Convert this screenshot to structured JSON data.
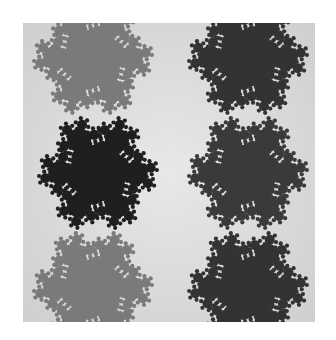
{
  "image": {
    "description": "Grayscale fractal tiling of snowflake-like dendritic clusters",
    "frame": {
      "x": 23,
      "y": 23,
      "width": 292,
      "height": 299
    },
    "background": {
      "light": "#d8d8d8",
      "center": "#e6e6e6"
    },
    "clusters": [
      {
        "name": "top-left",
        "cx": 70,
        "cy": 35,
        "color": "#7a7a7a"
      },
      {
        "name": "top-right",
        "cx": 225,
        "cy": 35,
        "color": "#333333"
      },
      {
        "name": "middle-left",
        "cx": 75,
        "cy": 150,
        "color": "#1f1f1f"
      },
      {
        "name": "middle-right",
        "cx": 225,
        "cy": 150,
        "color": "#3a3a3a"
      },
      {
        "name": "bottom-left",
        "cx": 70,
        "cy": 265,
        "color": "#7a7a7a"
      },
      {
        "name": "bottom-right",
        "cx": 225,
        "cy": 265,
        "color": "#333333"
      }
    ]
  }
}
